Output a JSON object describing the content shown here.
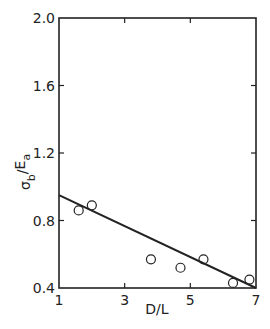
{
  "chart_data": {
    "type": "scatter",
    "title": "",
    "xlabel": "D/L",
    "ylabel": "σb / Ea",
    "xlim": [
      1,
      7
    ],
    "ylim": [
      0.4,
      2.0
    ],
    "x_ticks": [
      1,
      3,
      5,
      7
    ],
    "x_tick_labels": [
      "1",
      "3",
      "5",
      "7"
    ],
    "y_ticks": [
      0.4,
      0.8,
      1.2,
      1.6,
      2.0
    ],
    "y_tick_labels": [
      "0.4",
      "0.8",
      "1.2",
      "1.6",
      "2.0"
    ],
    "grid": false,
    "legend": null,
    "series": [
      {
        "name": "measured",
        "marker": "open-circle",
        "x": [
          1.6,
          2.0,
          3.8,
          4.7,
          5.4,
          6.3,
          6.8
        ],
        "y": [
          0.86,
          0.89,
          0.57,
          0.52,
          0.57,
          0.43,
          0.45
        ]
      },
      {
        "name": "fit line",
        "type": "line",
        "x": [
          1,
          7
        ],
        "y": [
          0.95,
          0.4
        ]
      }
    ]
  },
  "labels": {
    "xlabel": "D/L",
    "ylabel_sigma": "σ",
    "ylabel_sub_b": "b",
    "ylabel_slash": "/",
    "ylabel_E": "E",
    "ylabel_sub_a": "a"
  }
}
